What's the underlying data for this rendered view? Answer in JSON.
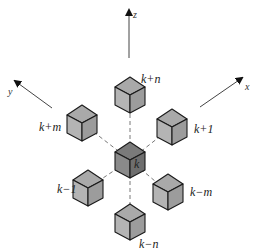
{
  "diagram": {
    "type": "3d-grid-neighborhood",
    "axes": [
      {
        "id": "z",
        "label": "z",
        "x1": 129,
        "y1": 58,
        "x2": 129,
        "y2": 10,
        "lx": 133,
        "ly": 18
      },
      {
        "id": "y",
        "label": "y",
        "x1": 52,
        "y1": 108,
        "x2": 15,
        "y2": 81,
        "lx": 8,
        "ly": 95
      },
      {
        "id": "x",
        "label": "x",
        "x1": 200,
        "y1": 107,
        "x2": 242,
        "y2": 78,
        "lx": 245,
        "ly": 90
      }
    ],
    "colors": {
      "center_top": "#7a7a7a",
      "center_left": "#8a8a8a",
      "center_right": "#6e6e6e",
      "neighbor_top": "#a9a9a9",
      "neighbor_left": "#b4b4b4",
      "neighbor_right": "#9c9c9c",
      "edge": "#1a1a1a",
      "axis": "#444444",
      "dash": "#555555"
    },
    "cubes": [
      {
        "id": "k+n",
        "label": "k+n",
        "cx": 130,
        "cy": 95,
        "lx": 141,
        "ly": 83,
        "center": false
      },
      {
        "id": "k+m",
        "label": "k+m",
        "cx": 82,
        "cy": 123,
        "lx": 39,
        "ly": 131,
        "center": false
      },
      {
        "id": "k+1",
        "label": "k+1",
        "cx": 172,
        "cy": 127,
        "lx": 194,
        "ly": 133,
        "center": false
      },
      {
        "id": "k",
        "label": "k",
        "cx": 130,
        "cy": 160,
        "lx": 134,
        "ly": 168,
        "center": true
      },
      {
        "id": "k-1",
        "label": "k−1",
        "cx": 88,
        "cy": 188,
        "lx": 57,
        "ly": 193,
        "center": false
      },
      {
        "id": "k-m",
        "label": "k−m",
        "cx": 168,
        "cy": 192,
        "lx": 190,
        "ly": 196,
        "center": false
      },
      {
        "id": "k-n",
        "label": "k−n",
        "cx": 130,
        "cy": 222,
        "lx": 139,
        "ly": 248,
        "center": false
      }
    ]
  }
}
